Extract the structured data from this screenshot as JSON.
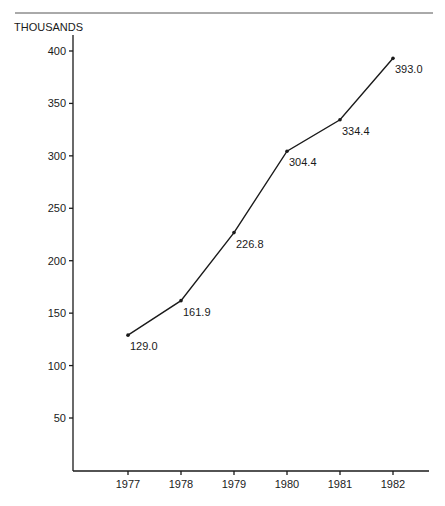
{
  "chart_data": {
    "type": "line",
    "title": "",
    "xlabel": "",
    "ylabel": "THOUSANDS",
    "categories": [
      "1977",
      "1978",
      "1979",
      "1980",
      "1981",
      "1982"
    ],
    "series": [
      {
        "name": "Value",
        "values": [
          129.0,
          161.9,
          226.8,
          304.4,
          334.4,
          393.0
        ]
      }
    ],
    "data_labels": [
      "129.0",
      "161.9",
      "226.8",
      "304.4",
      "334.4",
      "393.0"
    ],
    "y_ticks": [
      50,
      100,
      150,
      200,
      250,
      300,
      350,
      400
    ],
    "ylim": [
      0,
      420
    ],
    "grid": false,
    "legend": "none"
  },
  "colors": {
    "line": "#1a1a1a",
    "axis": "#1a1a1a",
    "rule": "#555555"
  }
}
